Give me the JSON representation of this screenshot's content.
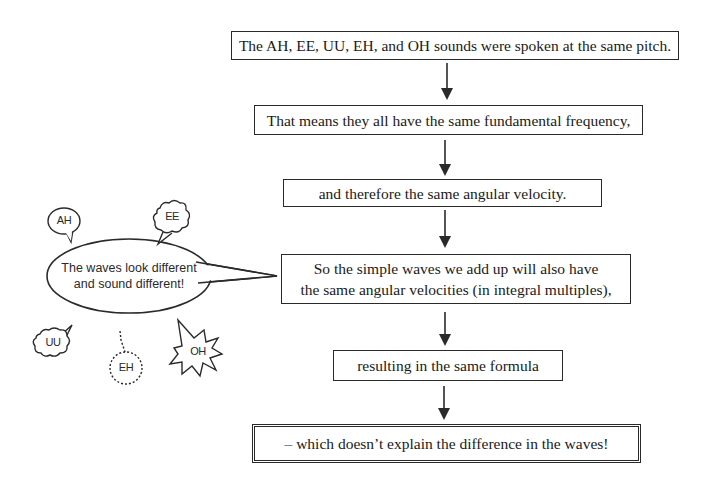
{
  "flowchart": {
    "steps": [
      {
        "id": "step1",
        "text": "The AH, EE, UU, EH, and OH sounds were spoken at the same pitch."
      },
      {
        "id": "step2",
        "text": "That means they all have the same fundamental frequency,"
      },
      {
        "id": "step3",
        "text": "and therefore the same angular velocity."
      },
      {
        "id": "step4",
        "line1": "So the simple waves we add up will also have",
        "line2": "the same angular velocities (in integral multiples),"
      },
      {
        "id": "step5",
        "text": "resulting in the same formula"
      },
      {
        "id": "step6",
        "text": "– which doesn’t explain the difference in the waves!"
      }
    ],
    "arrow_count": 5
  },
  "speech": {
    "main_bubble": {
      "line1": "The waves look different",
      "line2": "and sound different!"
    },
    "sounds": [
      {
        "label": "AH",
        "shape": "round-speech-bubble"
      },
      {
        "label": "EE",
        "shape": "cloud-bubble"
      },
      {
        "label": "UU",
        "shape": "cloud-bubble"
      },
      {
        "label": "EH",
        "shape": "dotted-whisper-bubble"
      },
      {
        "label": "OH",
        "shape": "starburst-shout-bubble"
      }
    ]
  },
  "colors": {
    "ink": "#2a2a2a",
    "background": "#ffffff"
  }
}
